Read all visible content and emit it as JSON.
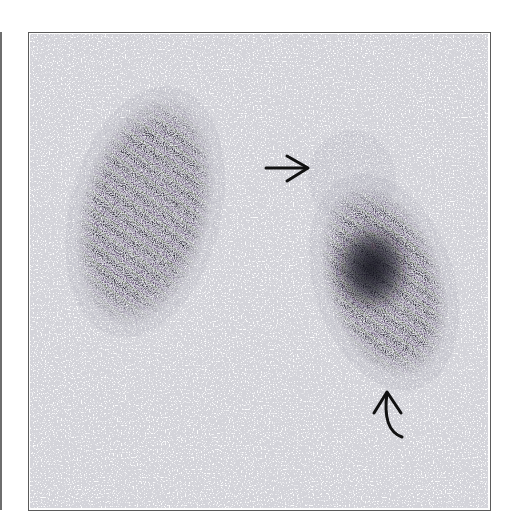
{
  "figure": {
    "type": "renal scintigraphy (posterior view)",
    "panel_count_visible": 1,
    "partial_adjacent_panel": "left edge"
  },
  "structures": {
    "left_kidney": {
      "label": "left-image kidney",
      "appearance": "homogeneous uptake"
    },
    "right_kidney": {
      "label": "right-image kidney",
      "appearance": "photopenic upper pole with intense lower pole uptake"
    }
  },
  "annotations": {
    "straight_arrow": {
      "label": "arrow",
      "direction": "right",
      "points_to": "upper pole of right-image kidney"
    },
    "curved_arrow": {
      "label": "curved arrow",
      "direction": "up",
      "points_to": "lower pole of right-image kidney"
    }
  },
  "colors": {
    "background": "#fdfdfd",
    "frame": "#5a5a5a",
    "uptake_dark": "#1e1a26",
    "uptake_purple": "#5e4670",
    "uptake_green": "#56624a",
    "halo_grey": "#9a9aa8",
    "arrow": "#111111"
  }
}
